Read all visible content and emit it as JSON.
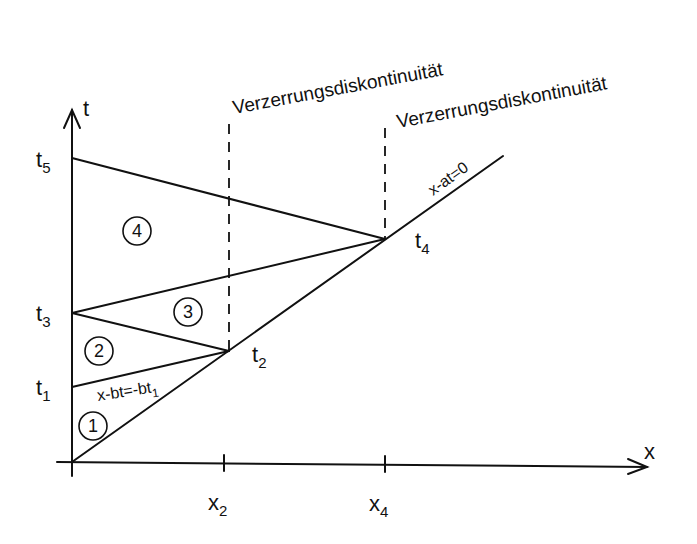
{
  "diagram": {
    "axes": {
      "t_label": "t",
      "x_label": "x"
    },
    "t_ticks": [
      {
        "base": "t",
        "sub": "5"
      },
      {
        "base": "t",
        "sub": "3"
      },
      {
        "base": "t",
        "sub": "1"
      }
    ],
    "x_ticks": [
      {
        "base": "x",
        "sub": "2"
      },
      {
        "base": "x",
        "sub": "4"
      }
    ],
    "point_labels": [
      {
        "base": "t",
        "sub": "2"
      },
      {
        "base": "t",
        "sub": "4"
      }
    ],
    "discontinuity_labels": [
      "Verzerrungsdiskontinuität",
      "Verzerrungsdiskontinuität"
    ],
    "line_labels": {
      "characteristic_a": "x-at=0",
      "characteristic_b_main": "x-bt=-bt",
      "characteristic_b_sub": "1"
    },
    "regions": [
      "1",
      "2",
      "3",
      "4"
    ]
  }
}
